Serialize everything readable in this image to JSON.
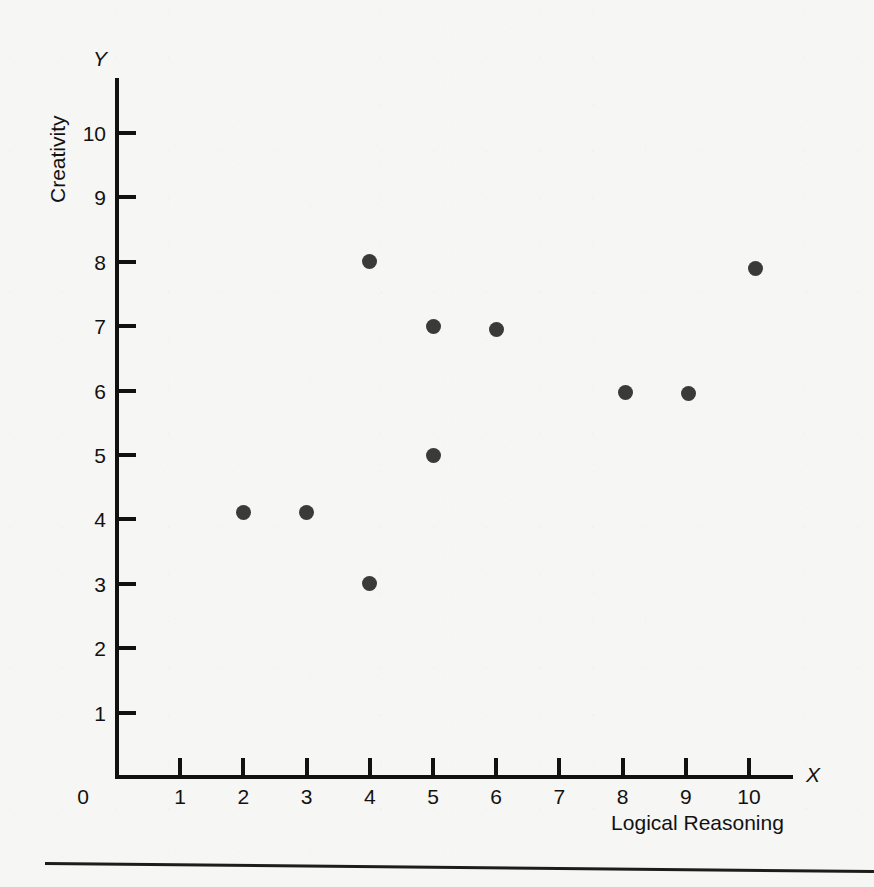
{
  "chart_data": {
    "type": "scatter",
    "title": "",
    "xlabel": "Logical Reasoning",
    "ylabel": "Creativity",
    "x_axis_symbol": "X",
    "y_axis_symbol": "Y",
    "xlim": [
      0,
      10.6
    ],
    "ylim": [
      0,
      10.85
    ],
    "grid": false,
    "legend": null,
    "origin_label": "0",
    "xticks": [
      1,
      2,
      3,
      4,
      5,
      6,
      7,
      8,
      9,
      10
    ],
    "xtick_labels": [
      "1",
      "2",
      "3",
      "4",
      "5",
      "6",
      "7",
      "8",
      "9",
      "10"
    ],
    "yticks": [
      1,
      2,
      3,
      4,
      5,
      6,
      7,
      8,
      9,
      10
    ],
    "ytick_labels": [
      "1",
      "2",
      "3",
      "4",
      "5",
      "6",
      "7",
      "8",
      "9",
      "10"
    ],
    "marker_color": "#3a3a3a",
    "axis_color": "#111111",
    "background_color": "#f6f6f4",
    "points": [
      {
        "x": 2.0,
        "y": 4.1
      },
      {
        "x": 3.0,
        "y": 4.1
      },
      {
        "x": 4.0,
        "y": 8.0
      },
      {
        "x": 4.0,
        "y": 3.0
      },
      {
        "x": 5.0,
        "y": 7.0
      },
      {
        "x": 5.0,
        "y": 5.0
      },
      {
        "x": 6.0,
        "y": 6.95
      },
      {
        "x": 8.05,
        "y": 5.97
      },
      {
        "x": 9.05,
        "y": 5.95
      },
      {
        "x": 10.1,
        "y": 7.9
      }
    ]
  },
  "figure": {
    "bottom_rule_visible": true
  }
}
